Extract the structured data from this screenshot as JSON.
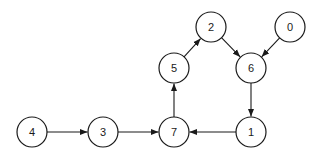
{
  "diagram": {
    "type": "directed-graph",
    "node_radius": 15,
    "nodes": [
      {
        "id": "0",
        "label": "0",
        "x": 290,
        "y": 27
      },
      {
        "id": "1",
        "label": "1",
        "x": 251,
        "y": 132
      },
      {
        "id": "2",
        "label": "2",
        "x": 211,
        "y": 27
      },
      {
        "id": "3",
        "label": "3",
        "x": 103,
        "y": 132
      },
      {
        "id": "4",
        "label": "4",
        "x": 32,
        "y": 132
      },
      {
        "id": "5",
        "label": "5",
        "x": 174,
        "y": 68
      },
      {
        "id": "6",
        "label": "6",
        "x": 251,
        "y": 68
      },
      {
        "id": "7",
        "label": "7",
        "x": 174,
        "y": 132
      }
    ],
    "edges": [
      {
        "from": "4",
        "to": "3"
      },
      {
        "from": "3",
        "to": "7"
      },
      {
        "from": "1",
        "to": "7"
      },
      {
        "from": "7",
        "to": "5"
      },
      {
        "from": "5",
        "to": "2"
      },
      {
        "from": "2",
        "to": "6"
      },
      {
        "from": "0",
        "to": "6"
      },
      {
        "from": "6",
        "to": "1"
      }
    ]
  }
}
